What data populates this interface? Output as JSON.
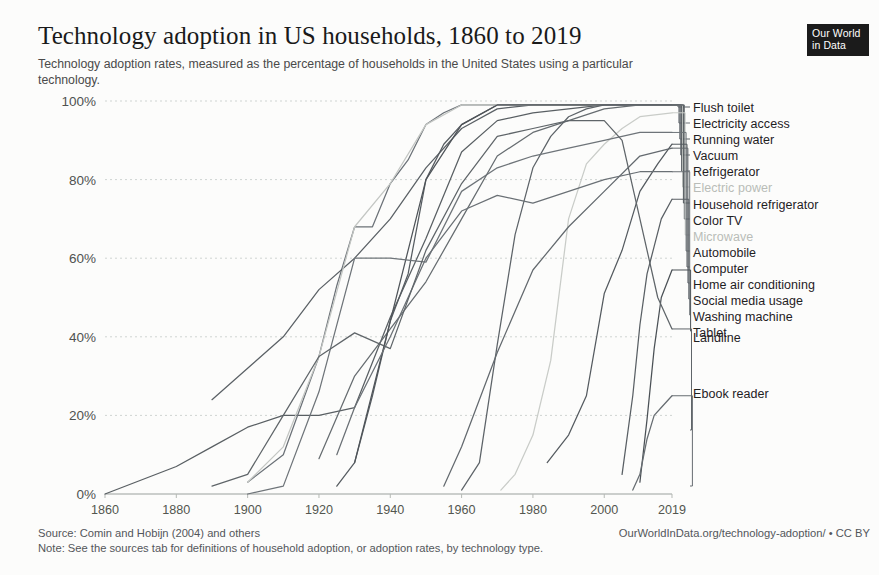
{
  "header": {
    "title": "Technology adoption in US households, 1860 to 2019",
    "subtitle": "Technology adoption rates, measured as the percentage of households in the United States using a particular technology."
  },
  "logo": {
    "line1": "Our World",
    "line2": "in Data"
  },
  "footer": {
    "source": "Source: Comin and Hobijn (2004) and others",
    "url": "OurWorldInData.org/technology-adoption/ • CC BY",
    "note": "Note: See the sources tab for definitions of household adoption, or adoption rates, by technology type."
  },
  "chart_data": {
    "type": "line",
    "title": "Technology adoption in US households, 1860 to 2019",
    "subtitle": "Technology adoption rates, measured as the percentage of households in the United States using a particular technology.",
    "xlabel": "",
    "ylabel": "",
    "xlim": [
      1860,
      2019
    ],
    "ylim": [
      0,
      100
    ],
    "grid": true,
    "legend_position": "right-direct-label",
    "x_ticks": [
      1860,
      1880,
      1900,
      1920,
      1940,
      1960,
      1980,
      2000,
      2019
    ],
    "x_tick_labels": [
      "1860",
      "1880",
      "1900",
      "1920",
      "1940",
      "1960",
      "1980",
      "2000",
      "2019"
    ],
    "y_ticks": [
      0,
      20,
      40,
      60,
      80,
      100
    ],
    "y_tick_labels": [
      "0%",
      "20%",
      "40%",
      "60%",
      "80%",
      "100%"
    ],
    "series": [
      {
        "name": "Flush toilet",
        "color": "#595f63",
        "faded": false,
        "label_y": 107,
        "x": [
          1860,
          1880,
          1890,
          1900,
          1910,
          1920,
          1930,
          1940,
          1950,
          1960,
          1970,
          1980,
          1990,
          2000,
          2010,
          2019
        ],
        "values": [
          0,
          7,
          12,
          17,
          20,
          20,
          22,
          45,
          65,
          87,
          95,
          97,
          98,
          99,
          99,
          99
        ]
      },
      {
        "name": "Electricity access",
        "color": "#6b7177",
        "faded": false,
        "label_y": 123,
        "x": [
          1900,
          1910,
          1920,
          1925,
          1930,
          1935,
          1940,
          1945,
          1950,
          1955,
          1960,
          1970,
          1980,
          1990,
          2000,
          2010,
          2019
        ],
        "values": [
          3,
          10,
          35,
          53,
          68,
          68,
          79,
          85,
          94,
          97,
          99,
          99,
          99,
          99,
          99,
          99,
          99
        ]
      },
      {
        "name": "Running water",
        "color": "#5a6065",
        "faded": false,
        "label_y": 139,
        "x": [
          1890,
          1900,
          1910,
          1920,
          1930,
          1940,
          1950,
          1960,
          1970,
          1980,
          1990,
          2000,
          2010,
          2019
        ],
        "values": [
          24,
          32,
          40,
          52,
          60,
          70,
          83,
          93,
          98,
          99,
          99,
          99,
          99,
          99
        ]
      },
      {
        "name": "Vacuum",
        "color": "#666c70",
        "faded": false,
        "label_y": 155,
        "x": [
          1920,
          1930,
          1940,
          1950,
          1960,
          1970,
          1980,
          1990,
          2000,
          2010,
          2019
        ],
        "values": [
          9,
          30,
          42,
          54,
          70,
          86,
          92,
          95,
          98,
          99,
          99
        ]
      },
      {
        "name": "Refrigerator",
        "color": "#555b60",
        "faded": false,
        "label_y": 171,
        "x": [
          1925,
          1930,
          1935,
          1940,
          1945,
          1950,
          1955,
          1960,
          1970,
          1980,
          1990,
          2000,
          2010,
          2019
        ],
        "values": [
          2,
          8,
          25,
          44,
          56,
          80,
          89,
          94,
          99,
          99,
          99,
          99,
          99,
          99
        ]
      },
      {
        "name": "Electric power",
        "color": "#c3c6c3",
        "faded": true,
        "label_y": 187,
        "x": [
          1900,
          1910,
          1920,
          1930,
          1940,
          1950,
          1960,
          1970,
          1980,
          1990,
          2000,
          2010,
          2019
        ],
        "values": [
          3,
          12,
          35,
          68,
          79,
          94,
          99,
          99,
          99,
          99,
          99,
          99,
          99
        ]
      },
      {
        "name": "Household refrigerator",
        "color": "#4f5459",
        "faded": false,
        "label_y": 203,
        "x": [
          1930,
          1940,
          1950,
          1960,
          1970,
          1980,
          1990,
          2000,
          2010,
          2019
        ],
        "values": [
          8,
          44,
          80,
          94,
          99,
          99,
          99,
          99,
          99,
          99
        ]
      },
      {
        "name": "Color TV",
        "color": "#5d6368",
        "faded": false,
        "label_y": 219,
        "x": [
          1960,
          1965,
          1970,
          1975,
          1980,
          1985,
          1990,
          1995,
          2000,
          2010,
          2019
        ],
        "values": [
          1,
          8,
          38,
          66,
          83,
          91,
          96,
          98,
          99,
          99,
          99
        ]
      },
      {
        "name": "Microwave",
        "color": "#c9ccc8",
        "faded": true,
        "label_y": 235,
        "x": [
          1971,
          1975,
          1980,
          1985,
          1990,
          1995,
          2000,
          2005,
          2010,
          2019
        ],
        "values": [
          1,
          5,
          15,
          34,
          70,
          84,
          89,
          93,
          96,
          97
        ]
      },
      {
        "name": "Automobile",
        "color": "#6e7479",
        "faded": false,
        "label_y": 251,
        "x": [
          1900,
          1910,
          1920,
          1930,
          1940,
          1950,
          1960,
          1970,
          1980,
          1990,
          2000,
          2010,
          2019
        ],
        "values": [
          0,
          2,
          26,
          60,
          60,
          59,
          77,
          83,
          86,
          88,
          90,
          92,
          92
        ]
      },
      {
        "name": "Computer",
        "color": "#545a5f",
        "faded": false,
        "label_y": 267,
        "x": [
          1984,
          1990,
          1995,
          2000,
          2005,
          2010,
          2015,
          2019
        ],
        "values": [
          8,
          15,
          25,
          51,
          62,
          77,
          84,
          89
        ]
      },
      {
        "name": "Home air conditioning",
        "color": "#63696e",
        "faded": false,
        "label_y": 283,
        "x": [
          1955,
          1960,
          1970,
          1980,
          1990,
          2000,
          2010,
          2019
        ],
        "values": [
          2,
          12,
          36,
          57,
          68,
          77,
          86,
          88
        ]
      },
      {
        "name": "Social media usage",
        "color": "#595f64",
        "faded": false,
        "label_y": 299,
        "x": [
          2005,
          2008,
          2010,
          2012,
          2014,
          2016,
          2019
        ],
        "values": [
          5,
          25,
          43,
          56,
          63,
          70,
          75
        ]
      },
      {
        "name": "Washing machine",
        "color": "#6a7075",
        "faded": false,
        "label_y": 315,
        "x": [
          1925,
          1930,
          1940,
          1950,
          1960,
          1970,
          1980,
          1990,
          2000,
          2010,
          2019
        ],
        "values": [
          10,
          22,
          40,
          60,
          72,
          76,
          74,
          77,
          80,
          82,
          82
        ]
      },
      {
        "name": "Tablet",
        "color": "#4b5156",
        "faded": false,
        "label_y": 331,
        "x": [
          2010,
          2012,
          2014,
          2016,
          2019
        ],
        "values": [
          3,
          19,
          37,
          50,
          57
        ]
      },
      {
        "name": "Landline",
        "color": "#5f6569",
        "faded": false,
        "label_y": 430,
        "x": [
          1890,
          1900,
          1910,
          1920,
          1930,
          1940,
          1950,
          1960,
          1970,
          1980,
          1990,
          2000,
          2005,
          2010,
          2015,
          2019
        ],
        "values": [
          2,
          5,
          20,
          35,
          41,
          37,
          62,
          79,
          91,
          93,
          95,
          95,
          90,
          70,
          50,
          42
        ]
      },
      {
        "name": "Ebook reader",
        "color": "#666c71",
        "faded": false,
        "label_y": 486,
        "x": [
          2008,
          2010,
          2012,
          2014,
          2016,
          2019
        ],
        "values": [
          1,
          5,
          14,
          20,
          22,
          25
        ]
      }
    ]
  }
}
